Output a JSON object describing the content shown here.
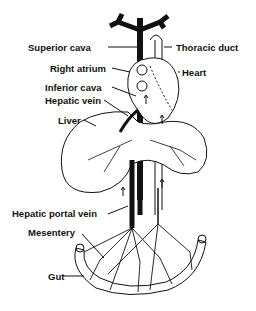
{
  "diagram": {
    "labels": {
      "superior_cava": "Superior cava",
      "thoracic_duct": "Thoracic duct",
      "right_atrium": "Right atrium",
      "heart": "Heart",
      "inferior_cava": "Inferior cava",
      "hepatic_vein": "Hepatic vein",
      "liver": "Liver",
      "hepatic_portal_vein": "Hepatic portal vein",
      "mesentery": "Mesentery",
      "gut": "Gut"
    }
  }
}
